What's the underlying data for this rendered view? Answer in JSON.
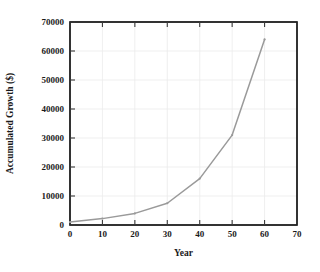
{
  "chart_data": {
    "type": "line",
    "title": "",
    "xlabel": "Year",
    "ylabel": "Accumulated Growth ($)",
    "xlim": [
      0,
      70
    ],
    "ylim": [
      0,
      70000
    ],
    "xticks": [
      0,
      10,
      20,
      30,
      40,
      50,
      60,
      70
    ],
    "xtick_labels": [
      "0",
      "10",
      "20",
      "30",
      "40",
      "50",
      "60",
      "70"
    ],
    "yticks": [
      0,
      10000,
      20000,
      30000,
      40000,
      50000,
      60000,
      70000
    ],
    "ytick_labels": [
      "0",
      "10000",
      "20000",
      "30000",
      "40000",
      "50000",
      "60000",
      "70000"
    ],
    "grid": true,
    "legend": false,
    "legend_position": "none",
    "series": [
      {
        "name": "Accumulated Growth",
        "color": "#9a9a9a",
        "marker": "dot",
        "x": [
          0,
          10,
          20,
          30,
          40,
          50,
          60
        ],
        "values": [
          1000,
          2200,
          4000,
          7500,
          16000,
          31000,
          64000
        ]
      }
    ]
  },
  "axes": {
    "frame_color": "#000000",
    "grid_color": "#ebebeb",
    "tick_color": "#3a3a3a"
  }
}
